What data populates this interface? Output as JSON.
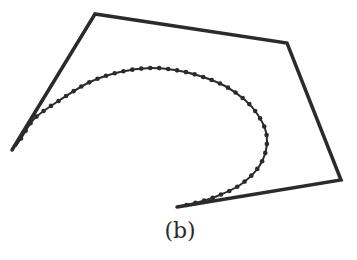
{
  "figure": {
    "label": "(b)",
    "stroke_color": "#2b2b2b",
    "control_polygon": {
      "points": [
        [
          12,
          150
        ],
        [
          95,
          14
        ],
        [
          287,
          43
        ],
        [
          341,
          180
        ],
        [
          177,
          207
        ]
      ],
      "stroke_width": 3.5
    },
    "curve": {
      "points": [
        [
          16,
          146
        ],
        [
          22,
          137
        ],
        [
          35,
          118
        ],
        [
          60,
          100
        ],
        [
          90,
          82
        ],
        [
          120,
          72
        ],
        [
          150,
          68
        ],
        [
          175,
          70
        ],
        [
          200,
          76
        ],
        [
          225,
          86
        ],
        [
          245,
          100
        ],
        [
          258,
          115
        ],
        [
          266,
          132
        ],
        [
          266,
          150
        ],
        [
          258,
          168
        ],
        [
          240,
          185
        ],
        [
          215,
          197
        ],
        [
          195,
          203
        ],
        [
          177,
          207
        ]
      ],
      "stroke_width": 2,
      "dot_radius": 2.3,
      "dot_spacing": 9
    }
  }
}
